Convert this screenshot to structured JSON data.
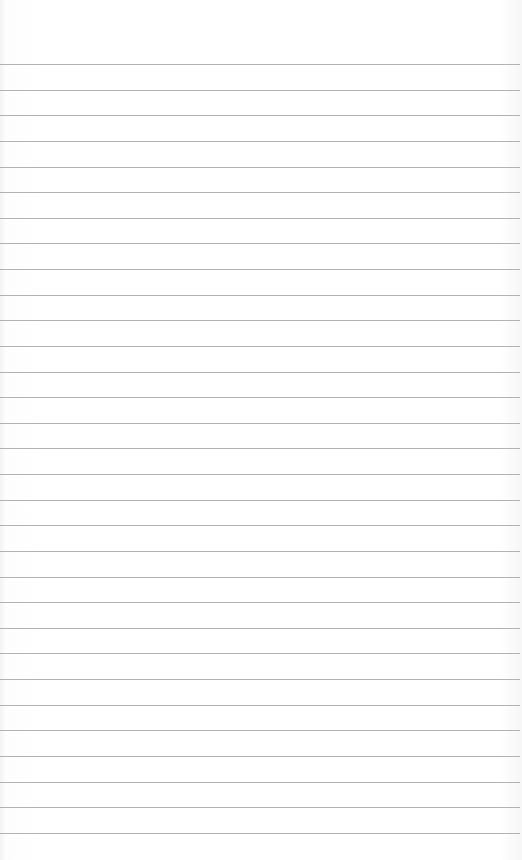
{
  "sheet": {
    "type": "lined-paper",
    "background_color": "#ffffff",
    "line_color": "#9a9a9a",
    "first_line_y": 64,
    "line_spacing": 25.63,
    "line_count": 31
  }
}
